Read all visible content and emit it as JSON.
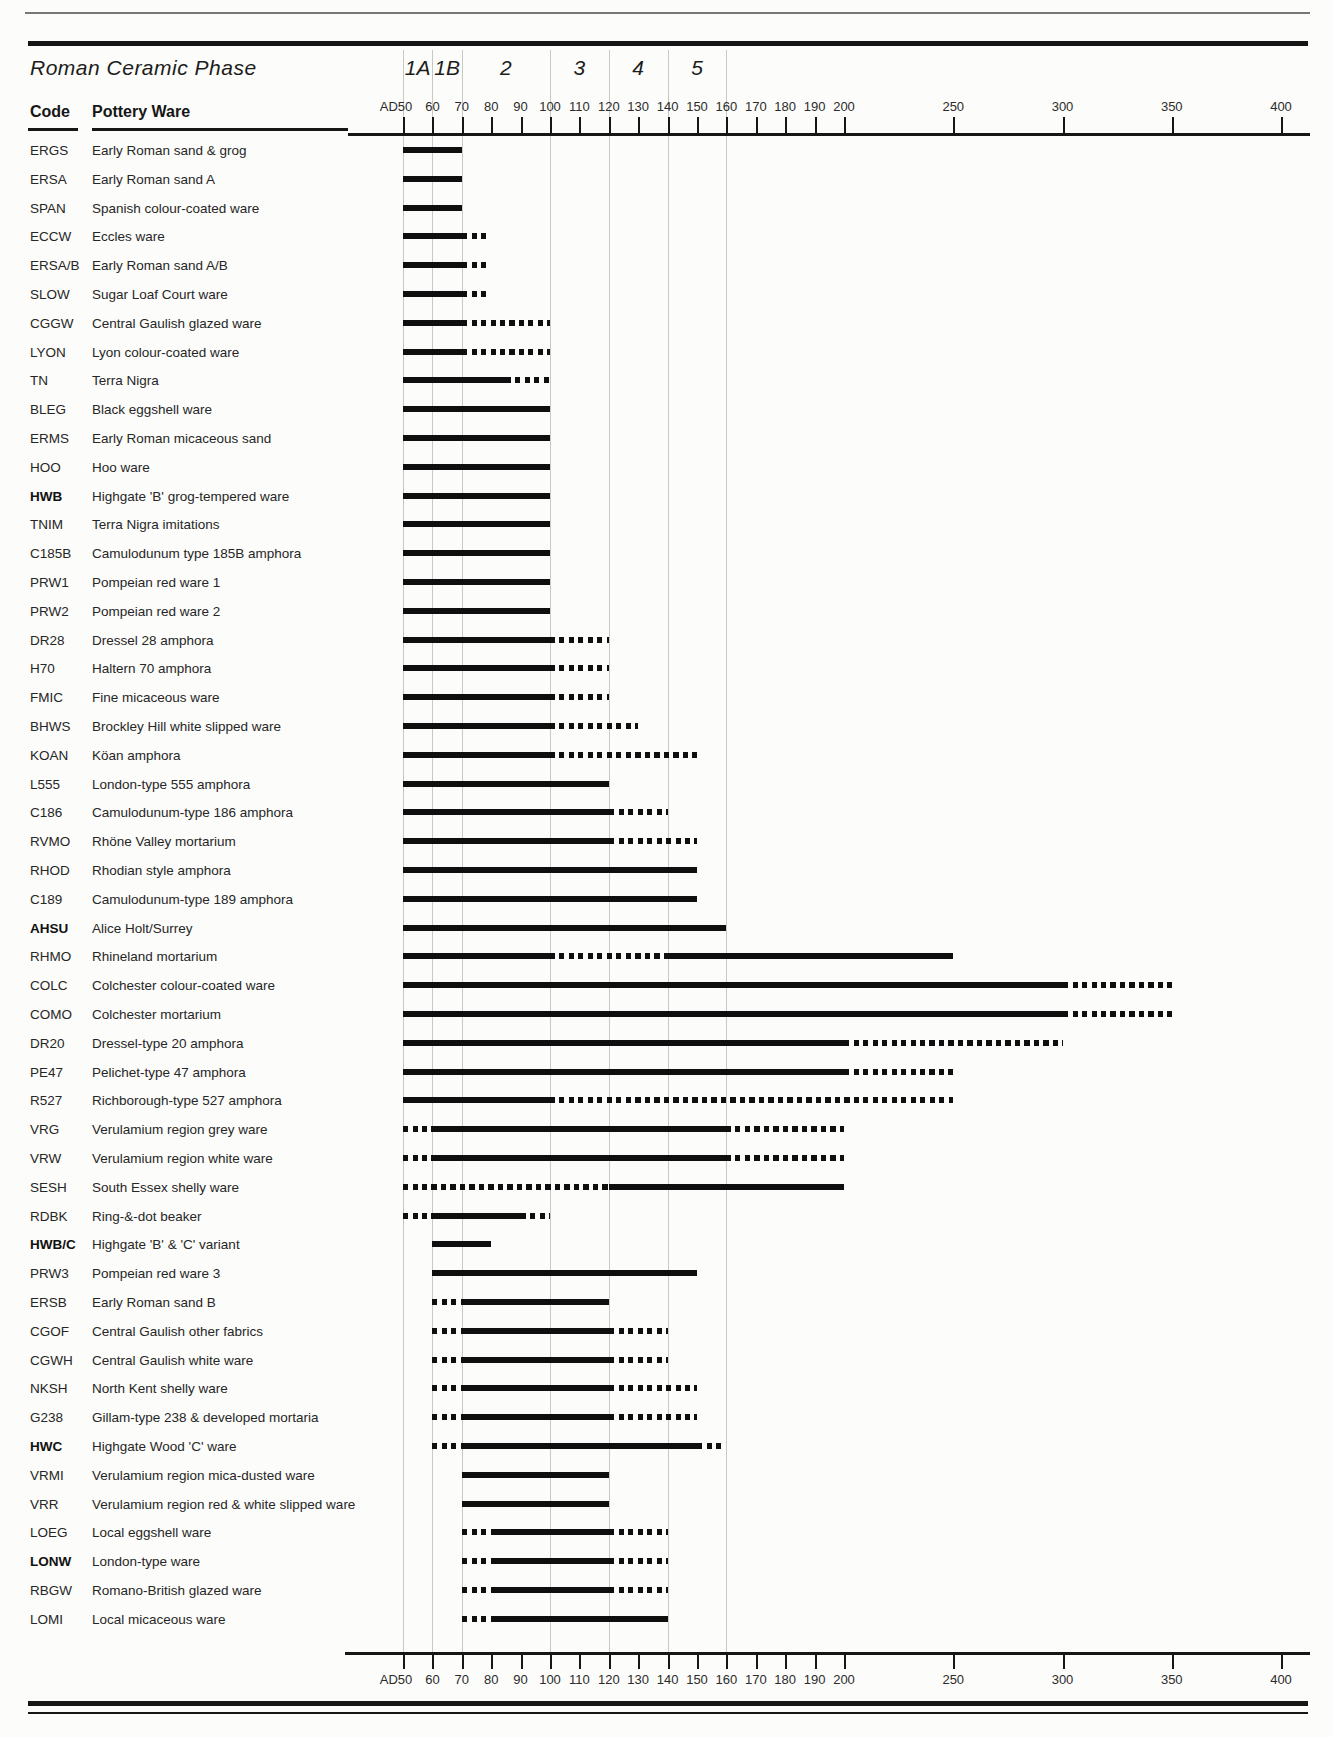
{
  "header": {
    "title": "Roman Ceramic Phase",
    "code_column_label": "Code",
    "ware_column_label": "Pottery Ware"
  },
  "colors": {
    "ink": "#0f0f0f",
    "gridline": "#c9c9c3",
    "paper": "#fcfcfa",
    "text": "#262626"
  },
  "chart_data": {
    "type": "bar",
    "subtype": "gantt-timeline",
    "unit": "years AD",
    "axis": {
      "min_year": 50,
      "max_year": 400,
      "scale_break_year": 200,
      "note": "linear 50-200, compressed linear 200-400",
      "gridline_years": [
        50,
        60,
        70,
        100,
        120,
        140,
        160
      ],
      "ticks": [
        {
          "year": 50,
          "label": "AD50"
        },
        {
          "year": 60,
          "label": "60"
        },
        {
          "year": 70,
          "label": "70"
        },
        {
          "year": 80,
          "label": "80"
        },
        {
          "year": 90,
          "label": "90"
        },
        {
          "year": 100,
          "label": "100"
        },
        {
          "year": 110,
          "label": "110"
        },
        {
          "year": 120,
          "label": "120"
        },
        {
          "year": 130,
          "label": "130"
        },
        {
          "year": 140,
          "label": "140"
        },
        {
          "year": 150,
          "label": "150"
        },
        {
          "year": 160,
          "label": "160"
        },
        {
          "year": 170,
          "label": "170"
        },
        {
          "year": 180,
          "label": "180"
        },
        {
          "year": 190,
          "label": "190"
        },
        {
          "year": 200,
          "label": "200"
        },
        {
          "year": 250,
          "label": "250"
        },
        {
          "year": 300,
          "label": "300"
        },
        {
          "year": 350,
          "label": "350"
        },
        {
          "year": 400,
          "label": "400"
        }
      ]
    },
    "phases": [
      {
        "label": "1A",
        "start": 50,
        "end": 60
      },
      {
        "label": "1B",
        "start": 60,
        "end": 70
      },
      {
        "label": "2",
        "start": 70,
        "end": 100
      },
      {
        "label": "3",
        "start": 100,
        "end": 120
      },
      {
        "label": "4",
        "start": 120,
        "end": 140
      },
      {
        "label": "5",
        "start": 140,
        "end": 160
      }
    ],
    "rows": [
      {
        "code": "ERGS",
        "bold": false,
        "ware": "Early Roman sand & grog",
        "segments": [
          {
            "style": "solid",
            "start": 50,
            "end": 70
          }
        ]
      },
      {
        "code": "ERSA",
        "bold": false,
        "ware": "Early Roman sand A",
        "segments": [
          {
            "style": "solid",
            "start": 50,
            "end": 70
          }
        ]
      },
      {
        "code": "SPAN",
        "bold": false,
        "ware": "Spanish colour-coated ware",
        "segments": [
          {
            "style": "solid",
            "start": 50,
            "end": 70
          }
        ]
      },
      {
        "code": "ECCW",
        "bold": false,
        "ware": "Eccles ware",
        "segments": [
          {
            "style": "solid",
            "start": 50,
            "end": 70
          },
          {
            "style": "dotted",
            "start": 70,
            "end": 80
          }
        ]
      },
      {
        "code": "ERSA/B",
        "bold": false,
        "ware": "Early Roman sand A/B",
        "segments": [
          {
            "style": "solid",
            "start": 50,
            "end": 70
          },
          {
            "style": "dotted",
            "start": 70,
            "end": 80
          }
        ]
      },
      {
        "code": "SLOW",
        "bold": false,
        "ware": "Sugar Loaf Court ware",
        "segments": [
          {
            "style": "solid",
            "start": 50,
            "end": 70
          },
          {
            "style": "dotted",
            "start": 70,
            "end": 80
          }
        ]
      },
      {
        "code": "CGGW",
        "bold": false,
        "ware": "Central Gaulish glazed ware",
        "segments": [
          {
            "style": "solid",
            "start": 50,
            "end": 70
          },
          {
            "style": "dotted",
            "start": 70,
            "end": 100
          }
        ]
      },
      {
        "code": "LYON",
        "bold": false,
        "ware": "Lyon colour-coated ware",
        "segments": [
          {
            "style": "solid",
            "start": 50,
            "end": 70
          },
          {
            "style": "dotted",
            "start": 70,
            "end": 100
          }
        ]
      },
      {
        "code": "TN",
        "bold": false,
        "ware": "Terra Nigra",
        "segments": [
          {
            "style": "solid",
            "start": 50,
            "end": 85
          },
          {
            "style": "dotted",
            "start": 85,
            "end": 100
          }
        ]
      },
      {
        "code": "BLEG",
        "bold": false,
        "ware": "Black eggshell ware",
        "segments": [
          {
            "style": "solid",
            "start": 50,
            "end": 100
          }
        ]
      },
      {
        "code": "ERMS",
        "bold": false,
        "ware": "Early Roman micaceous sand",
        "segments": [
          {
            "style": "solid",
            "start": 50,
            "end": 100
          }
        ]
      },
      {
        "code": "HOO",
        "bold": false,
        "ware": "Hoo ware",
        "segments": [
          {
            "style": "solid",
            "start": 50,
            "end": 100
          }
        ]
      },
      {
        "code": "HWB",
        "bold": true,
        "ware": "Highgate 'B' grog-tempered ware",
        "segments": [
          {
            "style": "solid",
            "start": 50,
            "end": 100
          }
        ]
      },
      {
        "code": "TNIM",
        "bold": false,
        "ware": "Terra Nigra imitations",
        "segments": [
          {
            "style": "solid",
            "start": 50,
            "end": 100
          }
        ]
      },
      {
        "code": "C185B",
        "bold": false,
        "ware": "Camulodunum type 185B amphora",
        "segments": [
          {
            "style": "solid",
            "start": 50,
            "end": 100
          }
        ]
      },
      {
        "code": "PRW1",
        "bold": false,
        "ware": "Pompeian red ware 1",
        "segments": [
          {
            "style": "solid",
            "start": 50,
            "end": 100
          }
        ]
      },
      {
        "code": "PRW2",
        "bold": false,
        "ware": "Pompeian red ware 2",
        "segments": [
          {
            "style": "solid",
            "start": 50,
            "end": 100
          }
        ]
      },
      {
        "code": "DR28",
        "bold": false,
        "ware": "Dressel 28 amphora",
        "segments": [
          {
            "style": "solid",
            "start": 50,
            "end": 100
          },
          {
            "style": "dotted",
            "start": 100,
            "end": 120
          }
        ]
      },
      {
        "code": "H70",
        "bold": false,
        "ware": "Haltern 70 amphora",
        "segments": [
          {
            "style": "solid",
            "start": 50,
            "end": 100
          },
          {
            "style": "dotted",
            "start": 100,
            "end": 120
          }
        ]
      },
      {
        "code": "FMIC",
        "bold": false,
        "ware": "Fine micaceous ware",
        "segments": [
          {
            "style": "solid",
            "start": 50,
            "end": 100
          },
          {
            "style": "dotted",
            "start": 100,
            "end": 120
          }
        ]
      },
      {
        "code": "BHWS",
        "bold": false,
        "ware": "Brockley Hill white slipped ware",
        "segments": [
          {
            "style": "solid",
            "start": 50,
            "end": 100
          },
          {
            "style": "dotted",
            "start": 100,
            "end": 130
          }
        ]
      },
      {
        "code": "KOAN",
        "bold": false,
        "ware": "Köan amphora",
        "segments": [
          {
            "style": "solid",
            "start": 50,
            "end": 100
          },
          {
            "style": "dotted",
            "start": 100,
            "end": 150
          }
        ]
      },
      {
        "code": "L555",
        "bold": false,
        "ware": "London-type 555 amphora",
        "segments": [
          {
            "style": "solid",
            "start": 50,
            "end": 120
          }
        ]
      },
      {
        "code": "C186",
        "bold": false,
        "ware": "Camulodunum-type 186 amphora",
        "segments": [
          {
            "style": "solid",
            "start": 50,
            "end": 120
          },
          {
            "style": "dotted",
            "start": 120,
            "end": 140
          }
        ]
      },
      {
        "code": "RVMO",
        "bold": false,
        "ware": "Rhöne Valley mortarium",
        "segments": [
          {
            "style": "solid",
            "start": 50,
            "end": 120
          },
          {
            "style": "dotted",
            "start": 120,
            "end": 150
          }
        ]
      },
      {
        "code": "RHOD",
        "bold": false,
        "ware": "Rhodian style amphora",
        "segments": [
          {
            "style": "solid",
            "start": 50,
            "end": 150
          }
        ]
      },
      {
        "code": "C189",
        "bold": false,
        "ware": "Camulodunum-type 189 amphora",
        "segments": [
          {
            "style": "solid",
            "start": 50,
            "end": 150
          }
        ]
      },
      {
        "code": "AHSU",
        "bold": true,
        "ware": "Alice Holt/Surrey",
        "segments": [
          {
            "style": "solid",
            "start": 50,
            "end": 160
          }
        ]
      },
      {
        "code": "RHMO",
        "bold": false,
        "ware": "Rhineland mortarium",
        "segments": [
          {
            "style": "solid",
            "start": 50,
            "end": 100
          },
          {
            "style": "dotted",
            "start": 100,
            "end": 140
          },
          {
            "style": "solid",
            "start": 140,
            "end": 250
          }
        ]
      },
      {
        "code": "COLC",
        "bold": false,
        "ware": "Colchester colour-coated ware",
        "segments": [
          {
            "style": "solid",
            "start": 50,
            "end": 300
          },
          {
            "style": "dotted",
            "start": 300,
            "end": 350
          }
        ]
      },
      {
        "code": "COMO",
        "bold": false,
        "ware": "Colchester mortarium",
        "segments": [
          {
            "style": "solid",
            "start": 50,
            "end": 300
          },
          {
            "style": "dotted",
            "start": 300,
            "end": 350
          }
        ]
      },
      {
        "code": "DR20",
        "bold": false,
        "ware": "Dressel-type 20 amphora",
        "segments": [
          {
            "style": "solid",
            "start": 50,
            "end": 200
          },
          {
            "style": "dotted",
            "start": 200,
            "end": 300
          }
        ]
      },
      {
        "code": "PE47",
        "bold": false,
        "ware": "Pelichet-type 47 amphora",
        "segments": [
          {
            "style": "solid",
            "start": 50,
            "end": 200
          },
          {
            "style": "dotted",
            "start": 200,
            "end": 250
          }
        ]
      },
      {
        "code": "R527",
        "bold": false,
        "ware": "Richborough-type 527 amphora",
        "segments": [
          {
            "style": "solid",
            "start": 50,
            "end": 100
          },
          {
            "style": "dotted",
            "start": 100,
            "end": 250
          }
        ]
      },
      {
        "code": "VRG",
        "bold": false,
        "ware": "Verulamium region grey ware",
        "segments": [
          {
            "style": "dotted",
            "start": 50,
            "end": 60
          },
          {
            "style": "solid",
            "start": 60,
            "end": 160
          },
          {
            "style": "dotted",
            "start": 160,
            "end": 200
          }
        ]
      },
      {
        "code": "VRW",
        "bold": false,
        "ware": "Verulamium region white ware",
        "segments": [
          {
            "style": "dotted",
            "start": 50,
            "end": 60
          },
          {
            "style": "solid",
            "start": 60,
            "end": 160
          },
          {
            "style": "dotted",
            "start": 160,
            "end": 200
          }
        ]
      },
      {
        "code": "SESH",
        "bold": false,
        "ware": "South Essex shelly ware",
        "segments": [
          {
            "style": "dotted",
            "start": 50,
            "end": 120
          },
          {
            "style": "solid",
            "start": 120,
            "end": 200
          }
        ]
      },
      {
        "code": "RDBK",
        "bold": false,
        "ware": "Ring-&-dot beaker",
        "segments": [
          {
            "style": "dotted",
            "start": 50,
            "end": 60
          },
          {
            "style": "solid",
            "start": 60,
            "end": 90
          },
          {
            "style": "dotted",
            "start": 90,
            "end": 100
          }
        ]
      },
      {
        "code": "HWB/C",
        "bold": true,
        "ware": "Highgate 'B' & 'C' variant",
        "segments": [
          {
            "style": "solid",
            "start": 60,
            "end": 80
          }
        ]
      },
      {
        "code": "PRW3",
        "bold": false,
        "ware": "Pompeian red ware 3",
        "segments": [
          {
            "style": "solid",
            "start": 60,
            "end": 150
          }
        ]
      },
      {
        "code": "ERSB",
        "bold": false,
        "ware": "Early Roman sand B",
        "segments": [
          {
            "style": "dotted",
            "start": 60,
            "end": 70
          },
          {
            "style": "solid",
            "start": 70,
            "end": 120
          }
        ]
      },
      {
        "code": "CGOF",
        "bold": false,
        "ware": "Central Gaulish other fabrics",
        "segments": [
          {
            "style": "dotted",
            "start": 60,
            "end": 70
          },
          {
            "style": "solid",
            "start": 70,
            "end": 120
          },
          {
            "style": "dotted",
            "start": 120,
            "end": 140
          }
        ]
      },
      {
        "code": "CGWH",
        "bold": false,
        "ware": "Central Gaulish white ware",
        "segments": [
          {
            "style": "dotted",
            "start": 60,
            "end": 70
          },
          {
            "style": "solid",
            "start": 70,
            "end": 120
          },
          {
            "style": "dotted",
            "start": 120,
            "end": 140
          }
        ]
      },
      {
        "code": "NKSH",
        "bold": false,
        "ware": "North Kent shelly ware",
        "segments": [
          {
            "style": "dotted",
            "start": 60,
            "end": 70
          },
          {
            "style": "solid",
            "start": 70,
            "end": 120
          },
          {
            "style": "dotted",
            "start": 120,
            "end": 150
          }
        ]
      },
      {
        "code": "G238",
        "bold": false,
        "ware": "Gillam-type 238 & developed mortaria",
        "segments": [
          {
            "style": "dotted",
            "start": 60,
            "end": 70
          },
          {
            "style": "solid",
            "start": 70,
            "end": 120
          },
          {
            "style": "dotted",
            "start": 120,
            "end": 150
          }
        ]
      },
      {
        "code": "HWC",
        "bold": true,
        "ware": "Highgate Wood 'C' ware",
        "segments": [
          {
            "style": "dotted",
            "start": 60,
            "end": 70
          },
          {
            "style": "solid",
            "start": 70,
            "end": 150
          },
          {
            "style": "dotted",
            "start": 150,
            "end": 160
          }
        ]
      },
      {
        "code": "VRMI",
        "bold": false,
        "ware": "Verulamium region mica-dusted ware",
        "segments": [
          {
            "style": "solid",
            "start": 70,
            "end": 120
          }
        ]
      },
      {
        "code": "VRR",
        "bold": false,
        "ware": "Verulamium region red & white slipped ware",
        "segments": [
          {
            "style": "solid",
            "start": 70,
            "end": 120
          }
        ]
      },
      {
        "code": "LOEG",
        "bold": false,
        "ware": "Local eggshell ware",
        "segments": [
          {
            "style": "dotted",
            "start": 70,
            "end": 80
          },
          {
            "style": "solid",
            "start": 80,
            "end": 120
          },
          {
            "style": "dotted",
            "start": 120,
            "end": 140
          }
        ]
      },
      {
        "code": "LONW",
        "bold": true,
        "ware": "London-type ware",
        "segments": [
          {
            "style": "dotted",
            "start": 70,
            "end": 80
          },
          {
            "style": "solid",
            "start": 80,
            "end": 120
          },
          {
            "style": "dotted",
            "start": 120,
            "end": 140
          }
        ]
      },
      {
        "code": "RBGW",
        "bold": false,
        "ware": "Romano-British glazed ware",
        "segments": [
          {
            "style": "dotted",
            "start": 70,
            "end": 80
          },
          {
            "style": "solid",
            "start": 80,
            "end": 120
          },
          {
            "style": "dotted",
            "start": 120,
            "end": 140
          }
        ]
      },
      {
        "code": "LOMI",
        "bold": false,
        "ware": "Local micaceous ware",
        "segments": [
          {
            "style": "dotted",
            "start": 70,
            "end": 80
          },
          {
            "style": "solid",
            "start": 80,
            "end": 140
          }
        ]
      }
    ]
  }
}
